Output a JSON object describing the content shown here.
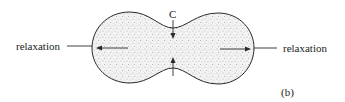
{
  "figure": {
    "left_label": "relaxation",
    "right_label": "relaxation",
    "center_label": "C",
    "panel_label": "(b)"
  },
  "colors": {
    "outline": "#2a2a2a",
    "fill_stipple": "#b8b8b8",
    "background": "#ffffff"
  }
}
